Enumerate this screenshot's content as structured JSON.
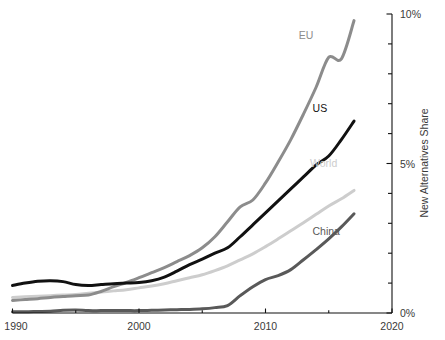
{
  "chart_data": {
    "type": "line",
    "title": "",
    "subtitle": "",
    "xlabel": "",
    "ylabel": "New Alternatives Share",
    "xlim": [
      1990,
      2020
    ],
    "ylim": [
      0,
      10
    ],
    "grid": false,
    "legend_position": "inline-end-of-line",
    "y_unit": "%",
    "x_ticks": [
      1990,
      2000,
      2010,
      2020
    ],
    "x_tick_labels": [
      "1990",
      "2000",
      "2010",
      "2020"
    ],
    "x_minor_ticks": [
      1995,
      2005,
      2015
    ],
    "y_ticks": [
      0,
      5,
      10
    ],
    "y_tick_labels": [
      "0%",
      "5%",
      "10%"
    ],
    "y_minor_ticks": [
      1,
      2,
      3,
      4,
      6,
      7,
      8,
      9
    ],
    "x": [
      1990,
      1991,
      1992,
      1993,
      1994,
      1995,
      1996,
      1997,
      1998,
      1999,
      2000,
      2001,
      2002,
      2003,
      2004,
      2005,
      2006,
      2007,
      2008,
      2009,
      2010,
      2011,
      2012,
      2013,
      2014,
      2015,
      2016,
      2017
    ],
    "series": [
      {
        "name": "EU",
        "label": "EU",
        "color": "#8c8c8c",
        "label_color": "#8c8c8c",
        "stroke_width": 3.0,
        "label_x": 2013.2,
        "label_y": 9.15,
        "values": [
          0.42,
          0.45,
          0.48,
          0.52,
          0.55,
          0.58,
          0.6,
          0.72,
          0.88,
          1.02,
          1.18,
          1.35,
          1.52,
          1.72,
          1.92,
          2.18,
          2.55,
          3.05,
          3.55,
          3.78,
          4.35,
          5.05,
          5.8,
          6.65,
          7.55,
          8.55,
          8.5,
          9.78
        ]
      },
      {
        "name": "US",
        "label": "US",
        "color": "#111111",
        "label_color": "#111111",
        "stroke_width": 3.0,
        "label_x": 2014.3,
        "label_y": 6.72,
        "values": [
          0.92,
          1.0,
          1.06,
          1.08,
          1.05,
          0.95,
          0.92,
          0.95,
          0.98,
          1.0,
          1.02,
          1.08,
          1.2,
          1.4,
          1.62,
          1.8,
          2.0,
          2.18,
          2.55,
          2.95,
          3.35,
          3.75,
          4.15,
          4.55,
          4.95,
          5.25,
          5.8,
          6.42
        ]
      },
      {
        "name": "World",
        "label": "World",
        "color": "#cdcdcd",
        "label_color": "#cdcdcd",
        "stroke_width": 3.0,
        "label_x": 2014.6,
        "label_y": 4.88,
        "values": [
          0.52,
          0.54,
          0.56,
          0.58,
          0.6,
          0.62,
          0.66,
          0.7,
          0.74,
          0.78,
          0.84,
          0.9,
          0.98,
          1.08,
          1.18,
          1.28,
          1.42,
          1.58,
          1.78,
          1.98,
          2.22,
          2.48,
          2.75,
          3.02,
          3.3,
          3.58,
          3.82,
          4.1
        ]
      },
      {
        "name": "China",
        "label": "China",
        "color": "#595959",
        "label_color": "#595959",
        "stroke_width": 3.0,
        "label_x": 2014.8,
        "label_y": 2.62,
        "values": [
          0.04,
          0.04,
          0.05,
          0.06,
          0.09,
          0.1,
          0.08,
          0.08,
          0.08,
          0.08,
          0.08,
          0.09,
          0.1,
          0.11,
          0.12,
          0.14,
          0.18,
          0.25,
          0.58,
          0.88,
          1.12,
          1.25,
          1.45,
          1.78,
          2.12,
          2.48,
          2.88,
          3.32
        ]
      }
    ]
  },
  "axes": {
    "y_axis_title": "New Alternatives Share"
  }
}
